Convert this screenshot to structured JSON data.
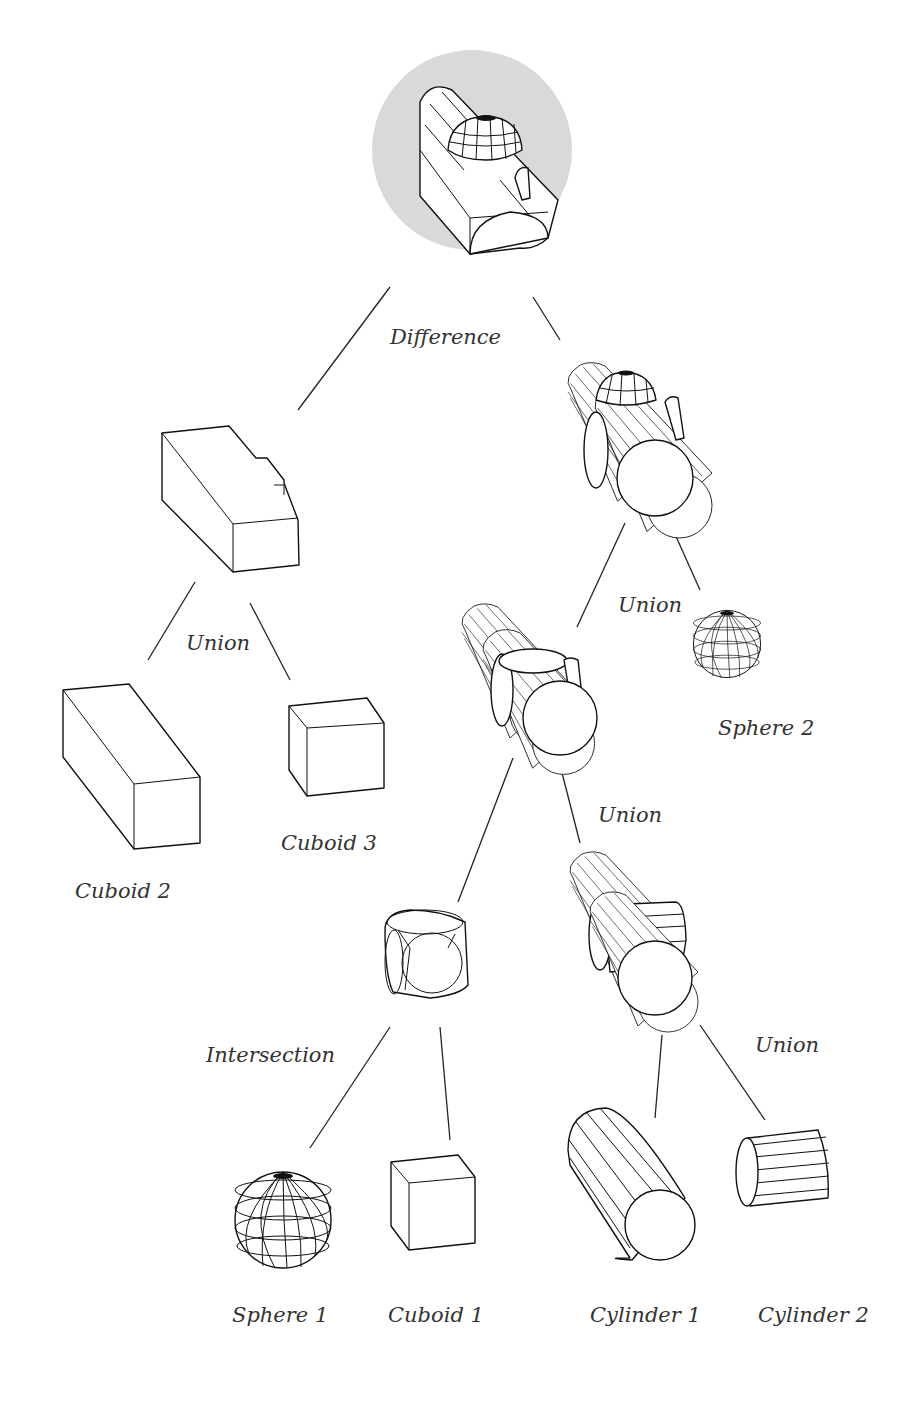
{
  "diagram": {
    "type": "csg-tree",
    "colors": {
      "root_highlight": "#d9d9d9",
      "stroke": "#111111",
      "text": "#333333"
    },
    "nodes": {
      "root": {
        "label": "Difference",
        "operation": "Difference",
        "highlighted": true
      },
      "left_union": {
        "label": "Union",
        "operation": "Union"
      },
      "right_union_top": {
        "label": "Union",
        "operation": "Union"
      },
      "right_union_mid": {
        "label": "Union",
        "operation": "Union"
      },
      "right_union_low": {
        "label": "Union",
        "operation": "Union"
      },
      "intersection": {
        "label": "Intersection",
        "operation": "Intersection"
      },
      "cuboid1": {
        "label": "Cuboid 1"
      },
      "cuboid2": {
        "label": "Cuboid 2"
      },
      "cuboid3": {
        "label": "Cuboid 3"
      },
      "sphere1": {
        "label": "Sphere 1"
      },
      "sphere2": {
        "label": "Sphere 2"
      },
      "cylinder1": {
        "label": "Cylinder 1"
      },
      "cylinder2": {
        "label": "Cylinder 2"
      }
    },
    "edges": [
      [
        "root",
        "left_union_result"
      ],
      [
        "root",
        "right_union_top_result"
      ],
      [
        "left_union_result",
        "cuboid2"
      ],
      [
        "left_union_result",
        "cuboid3"
      ],
      [
        "right_union_top_result",
        "right_union_mid_result"
      ],
      [
        "right_union_top_result",
        "sphere2"
      ],
      [
        "right_union_mid_result",
        "intersection_result"
      ],
      [
        "right_union_mid_result",
        "right_union_low_result"
      ],
      [
        "intersection_result",
        "sphere1"
      ],
      [
        "intersection_result",
        "cuboid1"
      ],
      [
        "right_union_low_result",
        "cylinder1"
      ],
      [
        "right_union_low_result",
        "cylinder2"
      ]
    ]
  }
}
